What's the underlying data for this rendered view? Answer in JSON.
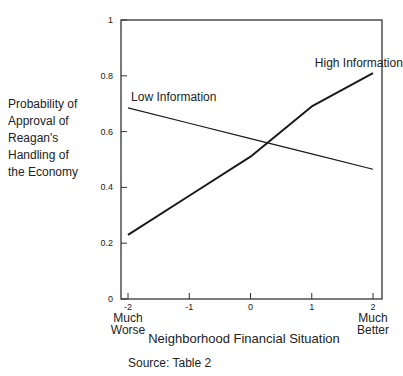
{
  "chart_data": {
    "type": "line",
    "title": "",
    "xlabel": "Neighborhood Financial Situation",
    "ylabel": "Probability of Approval of Reagan's Handling of the Economy",
    "ylabel_lines": [
      "Probability of",
      "Approval of",
      "Reagan's",
      "Handling of",
      "the Economy"
    ],
    "x": [
      -2,
      -1,
      0,
      1,
      2
    ],
    "x_tick_labels": [
      "-2",
      "-1",
      "0",
      "1",
      "2"
    ],
    "x_end_labels": {
      "left": [
        "Much",
        "Worse"
      ],
      "right": [
        "Much",
        "Better"
      ]
    },
    "y_ticks": [
      0,
      0.2,
      0.4,
      0.6,
      0.8,
      1
    ],
    "y_tick_labels": [
      "0",
      "0.2",
      "0.4",
      "0.6",
      "0.8",
      "1"
    ],
    "xlim": [
      -2,
      2
    ],
    "ylim": [
      0,
      1
    ],
    "grid": false,
    "series": [
      {
        "name": "High Information",
        "values": [
          0.23,
          0.37,
          0.51,
          0.69,
          0.81
        ],
        "stroke_width": 2
      },
      {
        "name": "Low Information",
        "values": [
          0.685,
          0.63,
          0.575,
          0.52,
          0.465
        ],
        "stroke_width": 1.2
      }
    ],
    "annotations": [
      {
        "text": "High Information",
        "x": 1.05,
        "y": 0.83
      },
      {
        "text": "Low Information",
        "x": -1.95,
        "y": 0.71
      }
    ],
    "source": "Source: Table 2"
  }
}
